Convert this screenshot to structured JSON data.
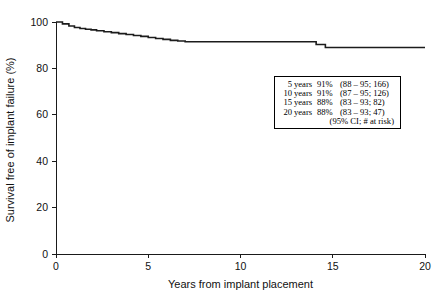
{
  "chart_data": {
    "type": "line",
    "title": "",
    "xlabel": "Years from implant placement",
    "ylabel": "Survival free of implant failure (%)",
    "xlim": [
      0,
      20
    ],
    "ylim": [
      0,
      100
    ],
    "xticks": [
      0,
      5,
      10,
      15,
      20
    ],
    "yticks": [
      0,
      20,
      40,
      60,
      80,
      100
    ],
    "xtick_labels": [
      "0",
      "5",
      "10",
      "15",
      "20"
    ],
    "ytick_labels": [
      "0",
      "20",
      "40",
      "60",
      "80",
      "100"
    ],
    "grid": false,
    "legend_position": "inside-right",
    "series": [
      {
        "name": "Kaplan-Meier survival free of implant failure",
        "step": true,
        "x": [
          0.0,
          0.35,
          0.7,
          1.0,
          1.3,
          1.6,
          1.9,
          2.2,
          2.6,
          3.0,
          3.4,
          3.8,
          4.2,
          4.6,
          5.0,
          5.4,
          5.8,
          6.2,
          6.6,
          7.0,
          13.6,
          14.1,
          14.6,
          20.0
        ],
        "y": [
          100.0,
          99.2,
          98.3,
          97.6,
          97.2,
          96.9,
          96.6,
          96.2,
          95.8,
          95.4,
          95.0,
          94.6,
          94.2,
          93.8,
          93.3,
          92.9,
          92.5,
          92.1,
          91.8,
          91.5,
          91.5,
          90.3,
          89.0,
          89.0
        ]
      }
    ]
  },
  "legend": {
    "rows": [
      {
        "time": "5",
        "unit": "years",
        "survival": "91%",
        "detail": "(88  – 95; 166)"
      },
      {
        "time": "10",
        "unit": "years",
        "survival": "91%",
        "detail": "(87 – 95; 126)"
      },
      {
        "time": "15",
        "unit": "years",
        "survival": "88%",
        "detail": "(83 – 93; 82)"
      },
      {
        "time": "20",
        "unit": "years",
        "survival": "88%",
        "detail": "(83 – 93; 47)"
      }
    ],
    "footnote": "(95% CI; # at risk)"
  },
  "colors": {
    "curve": "#1c1c1c",
    "axis": "#1a1a1a",
    "text": "#111111",
    "legend_border": "#000000",
    "background": "#ffffff"
  }
}
